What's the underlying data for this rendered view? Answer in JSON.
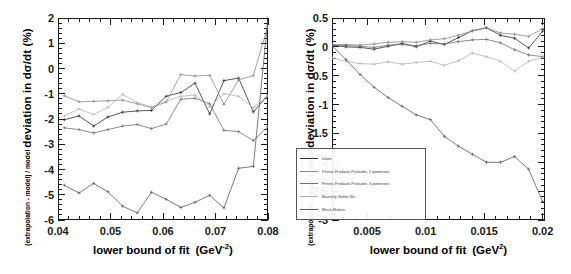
{
  "figure": {
    "kind": "two-panel-line-plot",
    "background": "#ffffff"
  },
  "series_styles": [
    {
      "name": "Islam",
      "color": "#2f2f2f"
    },
    {
      "name": "Petrov-Predazzi-Prokudin, 2 pomerons",
      "color": "#8a8a8a"
    },
    {
      "name": "Petrov-Predazzi-Prokudin, 3 pomerons",
      "color": "#707070"
    },
    {
      "name": "Bourrely-Soffer-Wu",
      "color": "#b4b4b4"
    },
    {
      "name": "Block-Halzen",
      "color": "#5a5a5a"
    }
  ],
  "legend": {
    "visible_on": "right-panel",
    "entries": [
      "Islam",
      "Petrov-Predazzi-Prokudin, 2 pomerons",
      "Petrov-Predazzi-Prokudin, 3 pomerons",
      "Bourrely-Soffer-Wu",
      "Block-Halzen"
    ]
  },
  "chart_data": [
    {
      "type": "line",
      "panel": "left",
      "title": "",
      "xlabel": "lower bound of fit   (GeV⁻²)",
      "xlabel_main": "lower bound of fit",
      "xlabel_unit": "(GeV",
      "xlabel_unit_exp": "-2",
      "ylabel": "deviation in dσ/dt   (%)",
      "ylabel_sub": "(extrapolation - model) / model",
      "xlim": [
        0.04,
        0.08
      ],
      "ylim": [
        -6,
        2
      ],
      "xticks": [
        0.04,
        0.05,
        0.06,
        0.07,
        0.08
      ],
      "xticklabels": [
        "0.04",
        "0.05",
        "0.06",
        "0.07",
        "0.08"
      ],
      "yticks": [
        -6,
        -5,
        -4,
        -3,
        -2,
        -1,
        0,
        1,
        2
      ],
      "yticklabels": [
        "-6",
        "-5",
        "-4",
        "-3",
        "-2",
        "-1",
        "0",
        "1",
        "2"
      ],
      "grid": false,
      "legend_position": "none",
      "x": [
        0.0412,
        0.044,
        0.0468,
        0.0495,
        0.0523,
        0.0551,
        0.0578,
        0.0606,
        0.0634,
        0.0661,
        0.0689,
        0.0716,
        0.0744,
        0.0772,
        0.08
      ],
      "series": [
        {
          "name": "Islam",
          "values": [
            -2.03,
            -1.88,
            -2.28,
            -1.92,
            -1.73,
            -1.68,
            -1.66,
            -1.1,
            -0.95,
            -0.58,
            -1.8,
            -0.48,
            -0.38,
            -1.72,
            -1.05
          ]
        },
        {
          "name": "Petrov-Predazzi-Prokudin, 2 pomerons",
          "values": [
            -1.08,
            -1.32,
            -1.3,
            -1.28,
            -1.25,
            -1.4,
            -1.55,
            -1.33,
            -0.24,
            -0.3,
            -0.27,
            -1.42,
            -0.45,
            -0.28,
            1.7
          ]
        },
        {
          "name": "Petrov-Predazzi-Prokudin, 3 pomerons",
          "values": [
            -2.35,
            -2.42,
            -2.55,
            -2.42,
            -2.28,
            -2.22,
            -2.38,
            -2.2,
            -1.22,
            -1.18,
            -1.4,
            -2.45,
            -2.5,
            -2.85,
            -2.3
          ]
        },
        {
          "name": "Bourrely-Soffer-Wu",
          "values": [
            -1.88,
            -1.6,
            -1.82,
            -1.55,
            -1.02,
            -1.35,
            -1.52,
            -1.3,
            -1.1,
            -1.05,
            -1.52,
            -1.0,
            -1.1,
            -1.55,
            -1.08
          ]
        },
        {
          "name": "Block-Halzen",
          "values": [
            -4.62,
            -4.93,
            -4.55,
            -4.88,
            -5.45,
            -5.72,
            -4.9,
            -5.18,
            -5.5,
            -5.3,
            -5.02,
            -5.52,
            -3.95,
            -3.88,
            2.0
          ]
        }
      ]
    },
    {
      "type": "line",
      "panel": "right",
      "title": "",
      "xlabel": "lower bound of fit   (GeV²)",
      "xlabel_main": "lower bound of fit",
      "xlabel_unit": "(GeV",
      "xlabel_unit_exp": "2",
      "ylabel": "deviation in dσ/dt   (%)",
      "ylabel_sub": "(extrapolation - model) / model",
      "xlim": [
        0.002,
        0.0202
      ],
      "ylim": [
        -3,
        0.5
      ],
      "xticks": [
        0.005,
        0.01,
        0.015,
        0.02
      ],
      "xticklabels": [
        "0.005",
        "0.01",
        "0.015",
        "0.02"
      ],
      "yticks": [
        -3,
        -2.5,
        -2,
        -1.5,
        -1,
        -0.5,
        0,
        0.5
      ],
      "yticklabels": [
        "-3",
        "-2.5",
        "-2",
        "-1.5",
        "-1",
        "-0.5",
        "0",
        "0.5"
      ],
      "grid": false,
      "legend_position": "lower-left",
      "x": [
        0.002,
        0.0032,
        0.0044,
        0.0056,
        0.0068,
        0.008,
        0.0092,
        0.0104,
        0.0116,
        0.0128,
        0.014,
        0.0152,
        0.0164,
        0.0176,
        0.0188,
        0.02
      ],
      "series": [
        {
          "name": "Islam",
          "values": [
            0.03,
            0.0,
            -0.01,
            -0.04,
            0.01,
            0.06,
            0.0,
            0.1,
            0.04,
            0.16,
            0.28,
            0.33,
            0.2,
            0.15,
            -0.02,
            0.27
          ]
        },
        {
          "name": "Petrov-Predazzi-Prokudin, 2 pomerons",
          "values": [
            0.04,
            0.04,
            0.03,
            0.05,
            0.08,
            0.09,
            0.08,
            0.12,
            0.14,
            0.2,
            0.28,
            0.33,
            0.24,
            0.22,
            0.18,
            0.32
          ]
        },
        {
          "name": "Petrov-Predazzi-Prokudin, 3 pomerons",
          "values": [
            0.03,
            0.02,
            0.01,
            -0.01,
            0.03,
            0.04,
            0.02,
            0.06,
            0.05,
            0.09,
            0.12,
            0.13,
            0.07,
            -0.05,
            -0.14,
            -0.17
          ]
        },
        {
          "name": "Bourrely-Soffer-Wu",
          "values": [
            -0.19,
            -0.25,
            -0.29,
            -0.3,
            -0.26,
            -0.3,
            -0.27,
            -0.25,
            -0.32,
            -0.24,
            -0.11,
            -0.17,
            -0.25,
            -0.42,
            -0.25,
            -0.18
          ]
        },
        {
          "name": "Block-Halzen",
          "values": [
            0.02,
            -0.22,
            -0.48,
            -0.7,
            -0.88,
            -1.03,
            -1.18,
            -1.26,
            -1.55,
            -1.72,
            -1.86,
            -2.0,
            -2.0,
            -1.9,
            -2.12,
            -2.68
          ]
        }
      ]
    }
  ]
}
